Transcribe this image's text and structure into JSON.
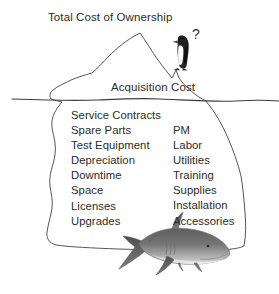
{
  "diagram": {
    "title": "Total Cost of Ownership",
    "above_water_label": "Acquisition Cost",
    "question_mark": "?",
    "hidden_costs_left": [
      "Service Contracts",
      "Spare Parts",
      "Test Equipment",
      "Depreciation",
      "Downtime",
      "Space",
      "Licenses",
      "Upgrades"
    ],
    "hidden_costs_right": [
      "PM",
      "Labor",
      "Utilities",
      "Training",
      "Supplies",
      "Installation",
      "Accessories"
    ],
    "icons": {
      "penguin": "penguin-icon",
      "shark": "shark-icon",
      "iceberg": "iceberg-shape",
      "waterline": "waterline"
    },
    "colors": {
      "background": "#ffffff",
      "text": "#2b2b2b",
      "outline": "#4a4a4a",
      "waterline": "#3d3d3d",
      "penguin_body": "#2e2e2e",
      "penguin_belly": "#ffffff",
      "shark_dorsal": "#6f6f6f",
      "shark_belly": "#d4d4d4"
    }
  }
}
